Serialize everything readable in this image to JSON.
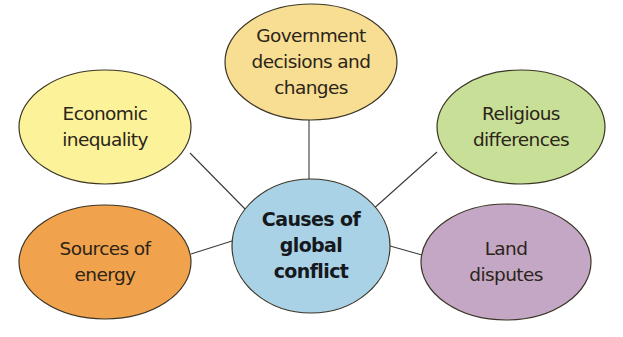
{
  "diagram": {
    "type": "mind-map",
    "center": {
      "lines": [
        "Causes of",
        "global",
        "conflict"
      ],
      "color": "#a9d2e6",
      "cx": 311,
      "cy": 246,
      "rx": 79,
      "ry": 67
    },
    "nodes": [
      {
        "id": "government",
        "lines": [
          "Government",
          "decisions and",
          "changes"
        ],
        "color": "#f8de93",
        "cx": 311,
        "cy": 62,
        "rx": 86,
        "ry": 58,
        "connector": {
          "x1": 309,
          "y1": 120,
          "x2": 309,
          "y2": 179
        }
      },
      {
        "id": "economic",
        "lines": [
          "Economic",
          "inequality"
        ],
        "color": "#fbf29a",
        "cx": 105,
        "cy": 127,
        "rx": 86,
        "ry": 57,
        "connector": {
          "x1": 190,
          "y1": 153,
          "x2": 247,
          "y2": 211
        }
      },
      {
        "id": "religious",
        "lines": [
          "Religious",
          "differences"
        ],
        "color": "#c8df98",
        "cx": 521,
        "cy": 127,
        "rx": 84,
        "ry": 57,
        "connector": {
          "x1": 437,
          "y1": 152,
          "x2": 371,
          "y2": 211
        }
      },
      {
        "id": "energy",
        "lines": [
          "Sources of",
          "energy"
        ],
        "color": "#f1a24c",
        "cx": 105,
        "cy": 262,
        "rx": 86,
        "ry": 57,
        "connector": {
          "x1": 191,
          "y1": 254,
          "x2": 232,
          "y2": 241
        }
      },
      {
        "id": "land",
        "lines": [
          "Land",
          "disputes"
        ],
        "color": "#c4a7c4",
        "cx": 506,
        "cy": 262,
        "rx": 85,
        "ry": 58,
        "connector": {
          "x1": 390,
          "y1": 246,
          "x2": 422,
          "y2": 255
        }
      }
    ]
  }
}
